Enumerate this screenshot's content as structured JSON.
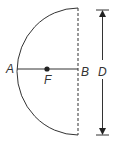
{
  "diagram": {
    "labels": {
      "point_a": "A",
      "point_b": "B",
      "point_f": "F",
      "diameter": "D"
    },
    "colors": {
      "stroke": "#333333",
      "background": "#ffffff"
    }
  }
}
